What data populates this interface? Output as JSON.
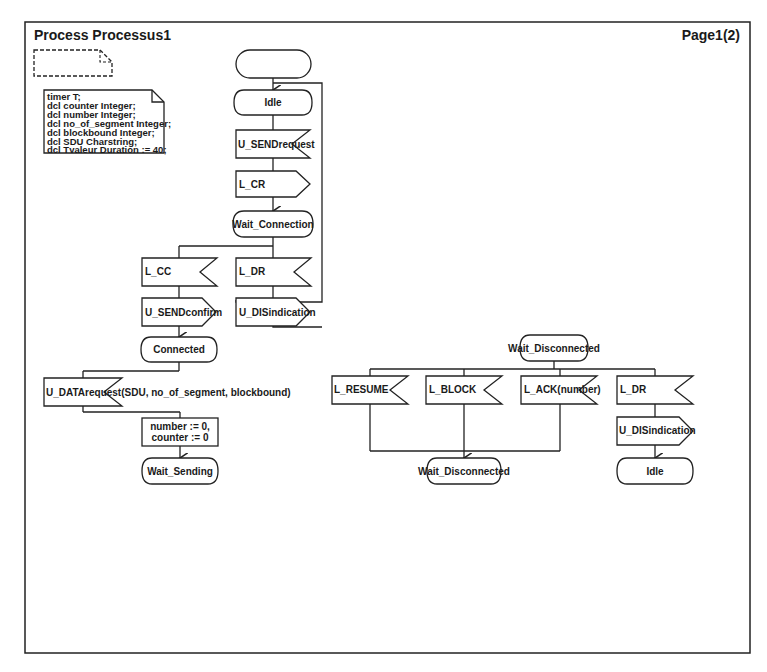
{
  "diagram": {
    "title": "Process Processus1",
    "page": "Page1(2)",
    "declarations": [
      "timer T;",
      "dcl counter Integer;",
      "dcl number Integer;",
      "dcl no_of_segment Integer;",
      "dcl blockbound Integer;",
      "dcl SDU Charstring;",
      "dcl Tvaleur Duration := 40;"
    ],
    "states": {
      "idle": "Idle",
      "wait_connection": "Wait_Connection",
      "connected": "Connected",
      "wait_sending": "Wait_Sending",
      "wait_disconnected_top": "Wait_Disconnected",
      "wait_disconnected_bottom": "Wait_Disconnected",
      "idle_bottom": "Idle"
    },
    "inputs": {
      "u_sendrequest": "U_SENDrequest",
      "l_cc": "L_CC",
      "l_dr_1": "L_DR",
      "u_datarequest": "U_DATArequest(SDU, no_of_segment, blockbound)",
      "l_resume": "L_RESUME",
      "l_block": "L_BLOCK",
      "l_ack": "L_ACK(number)",
      "l_dr_2": "L_DR"
    },
    "outputs": {
      "l_cr": "L_CR",
      "u_sendconfirm": "U_SENDconfirm",
      "u_disindication_1": "U_DISindication",
      "u_disindication_2": "U_DISindication"
    },
    "tasks": {
      "assign_line1": "number := 0,",
      "assign_line2": "counter := 0"
    }
  }
}
